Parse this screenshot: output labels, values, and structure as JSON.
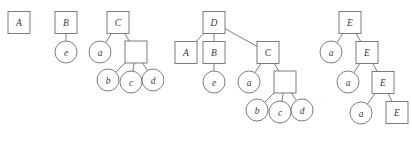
{
  "figure": {
    "name": "derivation-trees-figure",
    "background_color": "#ffffff",
    "stroke_color": "#6f6f6f",
    "label_color": "#3a3a3a"
  },
  "trees": [
    {
      "id": "tree-1",
      "name": "tree-a",
      "nodes": [
        {
          "id": "t1-n1",
          "label": "A",
          "shape": "square",
          "cx": 19,
          "cy": 22.5,
          "size": 22
        }
      ],
      "edges": []
    },
    {
      "id": "tree-2",
      "name": "tree-b",
      "nodes": [
        {
          "id": "t2-n1",
          "label": "B",
          "shape": "square",
          "cx": 66,
          "cy": 22.5,
          "size": 22
        },
        {
          "id": "t2-n2",
          "label": "e",
          "shape": "circle",
          "cx": 66,
          "cy": 52,
          "size": 22
        }
      ],
      "edges": [
        {
          "from": "t2-n1",
          "to": "t2-n2"
        }
      ]
    },
    {
      "id": "tree-3",
      "name": "tree-c",
      "nodes": [
        {
          "id": "t3-n1",
          "label": "C",
          "shape": "square",
          "cx": 118,
          "cy": 22.5,
          "size": 22
        },
        {
          "id": "t3-n2",
          "label": "a",
          "shape": "circle",
          "cx": 100,
          "cy": 52,
          "size": 22
        },
        {
          "id": "t3-n3",
          "label": "",
          "shape": "square",
          "cx": 136,
          "cy": 52,
          "size": 22
        },
        {
          "id": "t3-n4",
          "label": "b",
          "shape": "circle",
          "cx": 108,
          "cy": 80,
          "size": 22
        },
        {
          "id": "t3-n5",
          "label": "c",
          "shape": "circle",
          "cx": 131,
          "cy": 82,
          "size": 22
        },
        {
          "id": "t3-n6",
          "label": "d",
          "shape": "circle",
          "cx": 153,
          "cy": 80,
          "size": 22
        }
      ],
      "edges": [
        {
          "from": "t3-n1",
          "to": "t3-n2"
        },
        {
          "from": "t3-n1",
          "to": "t3-n3"
        },
        {
          "from": "t3-n3",
          "to": "t3-n4"
        },
        {
          "from": "t3-n3",
          "to": "t3-n5"
        },
        {
          "from": "t3-n3",
          "to": "t3-n6"
        }
      ]
    },
    {
      "id": "tree-4",
      "name": "tree-d",
      "nodes": [
        {
          "id": "t4-n1",
          "label": "D",
          "shape": "square",
          "cx": 214,
          "cy": 22.5,
          "size": 22
        },
        {
          "id": "t4-n2",
          "label": "A",
          "shape": "square",
          "cx": 186,
          "cy": 52.5,
          "size": 22
        },
        {
          "id": "t4-n3",
          "label": "B",
          "shape": "square",
          "cx": 214,
          "cy": 52.5,
          "size": 22
        },
        {
          "id": "t4-n4",
          "label": "C",
          "shape": "square",
          "cx": 268,
          "cy": 52.5,
          "size": 22
        },
        {
          "id": "t4-n5",
          "label": "e",
          "shape": "circle",
          "cx": 214,
          "cy": 82,
          "size": 22
        },
        {
          "id": "t4-n6",
          "label": "a",
          "shape": "circle",
          "cx": 249,
          "cy": 82,
          "size": 22
        },
        {
          "id": "t4-n7",
          "label": "",
          "shape": "square",
          "cx": 285,
          "cy": 82,
          "size": 22
        },
        {
          "id": "t4-n8",
          "label": "b",
          "shape": "circle",
          "cx": 257,
          "cy": 110,
          "size": 22
        },
        {
          "id": "t4-n9",
          "label": "c",
          "shape": "circle",
          "cx": 280,
          "cy": 112,
          "size": 22
        },
        {
          "id": "t4-n10",
          "label": "d",
          "shape": "circle",
          "cx": 302,
          "cy": 110,
          "size": 22
        }
      ],
      "edges": [
        {
          "from": "t4-n1",
          "to": "t4-n2"
        },
        {
          "from": "t4-n1",
          "to": "t4-n3"
        },
        {
          "from": "t4-n1",
          "to": "t4-n4"
        },
        {
          "from": "t4-n3",
          "to": "t4-n5"
        },
        {
          "from": "t4-n4",
          "to": "t4-n6"
        },
        {
          "from": "t4-n4",
          "to": "t4-n7"
        },
        {
          "from": "t4-n7",
          "to": "t4-n8"
        },
        {
          "from": "t4-n7",
          "to": "t4-n9"
        },
        {
          "from": "t4-n7",
          "to": "t4-n10"
        }
      ]
    },
    {
      "id": "tree-5",
      "name": "tree-e",
      "nodes": [
        {
          "id": "t5-n1",
          "label": "E",
          "shape": "square",
          "cx": 350,
          "cy": 22.5,
          "size": 22
        },
        {
          "id": "t5-n2",
          "label": "a",
          "shape": "circle",
          "cx": 331,
          "cy": 52,
          "size": 22
        },
        {
          "id": "t5-n3",
          "label": "E",
          "shape": "square",
          "cx": 367,
          "cy": 52.5,
          "size": 22
        },
        {
          "id": "t5-n4",
          "label": "a",
          "shape": "circle",
          "cx": 348,
          "cy": 82,
          "size": 22
        },
        {
          "id": "t5-n5",
          "label": "E",
          "shape": "square",
          "cx": 383,
          "cy": 82.5,
          "size": 22
        },
        {
          "id": "t5-n6",
          "label": "a",
          "shape": "circle",
          "cx": 361,
          "cy": 113,
          "size": 22
        },
        {
          "id": "t5-n7",
          "label": "E",
          "shape": "square",
          "cx": 397,
          "cy": 112.5,
          "size": 22
        }
      ],
      "edges": [
        {
          "from": "t5-n1",
          "to": "t5-n2"
        },
        {
          "from": "t5-n1",
          "to": "t5-n3"
        },
        {
          "from": "t5-n3",
          "to": "t5-n4"
        },
        {
          "from": "t5-n3",
          "to": "t5-n5"
        },
        {
          "from": "t5-n5",
          "to": "t5-n6"
        },
        {
          "from": "t5-n5",
          "to": "t5-n7"
        }
      ]
    }
  ]
}
